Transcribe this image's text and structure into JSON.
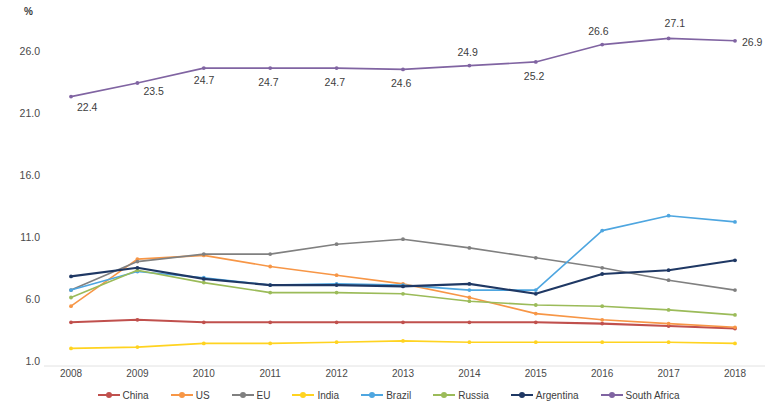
{
  "chart_data": {
    "type": "line",
    "title": "",
    "subtitle": "",
    "xlabel": "",
    "ylabel": "%",
    "y_unit_symbol": "%",
    "categories": [
      "2008",
      "2009",
      "2010",
      "2011",
      "2012",
      "2013",
      "2014",
      "2015",
      "2016",
      "2017",
      "2018"
    ],
    "x": [
      2008,
      2009,
      2010,
      2011,
      2012,
      2013,
      2014,
      2015,
      2016,
      2017,
      2018
    ],
    "ylim": [
      1.0,
      26.0
    ],
    "yticks": [
      1.0,
      6.0,
      11.0,
      16.0,
      21.0,
      26.0
    ],
    "ytick_labels": [
      "1.0",
      "6.0",
      "11.0",
      "16.0",
      "21.0",
      "26.0"
    ],
    "grid": false,
    "legend_position": "bottom",
    "markers": true,
    "series": [
      {
        "name": "China",
        "color": "#c0504d",
        "values": [
          4.2,
          4.4,
          4.2,
          4.2,
          4.2,
          4.2,
          4.2,
          4.2,
          4.1,
          3.9,
          3.7
        ],
        "labels": []
      },
      {
        "name": "US",
        "color": "#f79646",
        "values": [
          5.5,
          9.3,
          9.6,
          8.7,
          8.0,
          7.3,
          6.2,
          4.9,
          4.4,
          4.1,
          3.8
        ],
        "labels": []
      },
      {
        "name": "EU",
        "color": "#808080",
        "values": [
          6.8,
          9.1,
          9.7,
          9.7,
          10.5,
          10.9,
          10.2,
          9.4,
          8.6,
          7.6,
          6.8
        ],
        "labels": []
      },
      {
        "name": "India",
        "color": "#ffd320",
        "values": [
          2.1,
          2.2,
          2.5,
          2.5,
          2.6,
          2.7,
          2.6,
          2.6,
          2.6,
          2.6,
          2.5
        ],
        "labels": []
      },
      {
        "name": "Brazil",
        "color": "#4ea6e0",
        "values": [
          6.8,
          8.3,
          7.8,
          7.2,
          7.3,
          7.2,
          6.8,
          6.8,
          11.6,
          12.8,
          12.3
        ],
        "labels": []
      },
      {
        "name": "Russia",
        "color": "#9bbb59",
        "values": [
          6.2,
          8.4,
          7.4,
          6.6,
          6.6,
          6.5,
          5.9,
          5.6,
          5.5,
          5.2,
          4.8
        ],
        "labels": []
      },
      {
        "name": "Argentina",
        "color": "#1f3864",
        "values": [
          7.9,
          8.6,
          7.7,
          7.2,
          7.2,
          7.1,
          7.3,
          6.5,
          8.1,
          8.4,
          9.2
        ],
        "labels": []
      },
      {
        "name": "South Africa",
        "color": "#8064a2",
        "values": [
          22.4,
          23.5,
          24.7,
          24.7,
          24.7,
          24.6,
          24.9,
          25.2,
          26.6,
          27.1,
          26.9
        ],
        "labels": [
          "22.4",
          "23.5",
          "24.7",
          "24.7",
          "24.7",
          "24.6",
          "24.9",
          "25.2",
          "26.6",
          "27.1",
          "26.9"
        ]
      }
    ]
  },
  "legend": {
    "items": [
      {
        "label": "China",
        "color": "#c0504d"
      },
      {
        "label": "US",
        "color": "#f79646"
      },
      {
        "label": "EU",
        "color": "#808080"
      },
      {
        "label": "India",
        "color": "#ffd320"
      },
      {
        "label": "Brazil",
        "color": "#4ea6e0"
      },
      {
        "label": "Russia",
        "color": "#9bbb59"
      },
      {
        "label": "Argentina",
        "color": "#1f3864"
      },
      {
        "label": "South Africa",
        "color": "#8064a2"
      }
    ]
  }
}
